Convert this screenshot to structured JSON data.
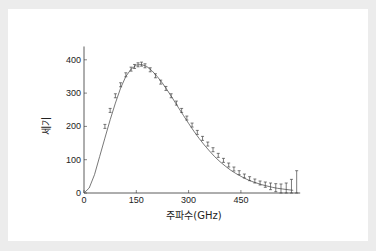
{
  "chart_data": {
    "type": "line",
    "title": "",
    "xlabel": "주파수(GHz)",
    "ylabel": "세기",
    "xlim": [
      0,
      620
    ],
    "ylim": [
      0,
      440
    ],
    "xticks": [
      0,
      150,
      300,
      450
    ],
    "yticks": [
      0,
      100,
      200,
      300,
      400
    ],
    "grid": false,
    "legend": null,
    "series": [
      {
        "name": "theory-curve",
        "style": "line",
        "x": [
          0,
          15,
          30,
          45,
          60,
          75,
          90,
          105,
          120,
          135,
          150,
          165,
          180,
          195,
          210,
          225,
          240,
          255,
          270,
          285,
          300,
          315,
          330,
          345,
          360,
          375,
          390,
          405,
          420,
          435,
          450,
          465,
          480,
          495,
          510,
          525,
          540,
          555,
          570,
          585,
          600
        ],
        "y": [
          0,
          15,
          55,
          110,
          165,
          220,
          270,
          315,
          350,
          372,
          384,
          386,
          380,
          367,
          350,
          330,
          307,
          283,
          258,
          233,
          209,
          186,
          164,
          144,
          126,
          109,
          94,
          81,
          69,
          59,
          50,
          42,
          35,
          30,
          25,
          21,
          17,
          14,
          12,
          10,
          8
        ]
      },
      {
        "name": "measured-data",
        "style": "errorbar",
        "x": [
          60,
          75,
          90,
          105,
          120,
          135,
          145,
          155,
          165,
          175,
          190,
          205,
          220,
          235,
          250,
          265,
          280,
          295,
          310,
          325,
          340,
          355,
          370,
          385,
          400,
          415,
          430,
          445,
          460,
          475,
          490,
          505,
          520,
          535,
          550,
          565,
          580,
          595,
          610
        ],
        "y": [
          200,
          248,
          292,
          325,
          355,
          372,
          380,
          385,
          387,
          382,
          370,
          352,
          333,
          314,
          292,
          270,
          248,
          225,
          204,
          182,
          164,
          147,
          130,
          113,
          98,
          84,
          72,
          61,
          51,
          43,
          36,
          30,
          25,
          20,
          16,
          13,
          12,
          16,
          25
        ],
        "err": [
          6,
          6,
          6,
          6,
          6,
          6,
          6,
          6,
          6,
          6,
          6,
          6,
          6,
          6,
          6,
          6,
          6,
          6,
          6,
          6,
          6,
          6,
          6,
          6,
          6,
          6,
          6,
          6,
          6,
          6,
          6,
          6,
          8,
          10,
          12,
          14,
          18,
          25,
          42
        ]
      }
    ]
  },
  "labels": {
    "xlabel": "주파수(GHz)",
    "ylabel": "세기",
    "xticks": [
      "0",
      "150",
      "300",
      "450"
    ],
    "yticks": [
      "0",
      "100",
      "200",
      "300",
      "400"
    ]
  },
  "colors": {
    "line": "#555555",
    "errorbar": "#444444",
    "axis": "#333333",
    "background": "#ffffff",
    "frame": "#ececec"
  }
}
